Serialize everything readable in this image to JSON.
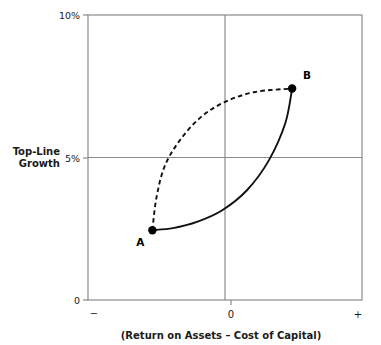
{
  "chart_data": {
    "type": "line",
    "title": "",
    "xlabel": "(Return on Assets – Cost of Capital)",
    "ylabel": "Top-Line Growth",
    "ylabel_line1": "Top-Line",
    "ylabel_line2": "Growth",
    "xlim": [
      -1,
      1
    ],
    "ylim": [
      0,
      10
    ],
    "grid": true,
    "gridlines": {
      "vertical_at_x": 0,
      "horizontal_at_y": 5
    },
    "y_ticks": [
      {
        "value": 10,
        "label": "10%"
      },
      {
        "value": 5,
        "label": "5%"
      },
      {
        "value": 0,
        "label": "0"
      }
    ],
    "x_ticks": [
      {
        "value": -1,
        "label": "−"
      },
      {
        "value": 0,
        "label": "0"
      },
      {
        "value": 1,
        "label": "+"
      }
    ],
    "points": [
      {
        "name": "A",
        "label": "A",
        "x": -0.53,
        "y": 2.45
      },
      {
        "name": "B",
        "label": "B",
        "x": 0.49,
        "y": 7.42
      }
    ],
    "series": [
      {
        "name": "upper-path",
        "style": "dashed",
        "color": "#111111",
        "from": "A",
        "to": "B",
        "description": "Dashed trajectory bowing up and to the left: steep early top-line growth, then flattening as returns improve",
        "path_points": [
          {
            "x": -0.53,
            "y": 2.45
          },
          {
            "x": -0.5,
            "y": 3.6
          },
          {
            "x": -0.44,
            "y": 4.7
          },
          {
            "x": -0.33,
            "y": 5.6
          },
          {
            "x": -0.18,
            "y": 6.4
          },
          {
            "x": 0.0,
            "y": 6.95
          },
          {
            "x": 0.22,
            "y": 7.3
          },
          {
            "x": 0.49,
            "y": 7.42
          }
        ]
      },
      {
        "name": "lower-path",
        "style": "solid",
        "color": "#111111",
        "from": "A",
        "to": "B",
        "description": "Solid trajectory bowing down and to the right: returns improve first with flat top-line growth, then growth accelerates",
        "path_points": [
          {
            "x": -0.53,
            "y": 2.45
          },
          {
            "x": -0.38,
            "y": 2.52
          },
          {
            "x": -0.2,
            "y": 2.75
          },
          {
            "x": -0.02,
            "y": 3.15
          },
          {
            "x": 0.16,
            "y": 3.85
          },
          {
            "x": 0.32,
            "y": 4.9
          },
          {
            "x": 0.44,
            "y": 6.2
          },
          {
            "x": 0.49,
            "y": 7.42
          }
        ]
      }
    ],
    "colors": {
      "frame": "#8a8a8a",
      "gridline": "#8a8a8a",
      "curve": "#111111",
      "marker": "#000000",
      "text": "#1a1a1a",
      "background": "#ffffff"
    }
  }
}
